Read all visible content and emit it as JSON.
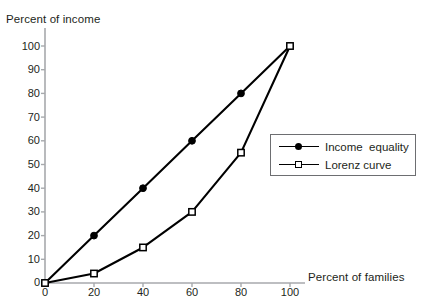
{
  "chart_data": {
    "type": "line",
    "title": "",
    "xlabel": "Percent of families",
    "ylabel": "Percent of income",
    "xlim": [
      0,
      100
    ],
    "ylim": [
      0,
      100
    ],
    "xticks": [
      "0",
      "20",
      "40",
      "60",
      "80",
      "100"
    ],
    "xtick_values": [
      0,
      20,
      40,
      60,
      80,
      100
    ],
    "yticks": [
      "0",
      "10",
      "20",
      "30",
      "40",
      "50",
      "60",
      "70",
      "80",
      "90",
      "100"
    ],
    "ytick_values": [
      0,
      10,
      20,
      30,
      40,
      50,
      60,
      70,
      80,
      90,
      100
    ],
    "grid": false,
    "legend_position": "right-middle",
    "series": [
      {
        "name": "Income  equality",
        "marker": "filled-circle",
        "color": "#000000",
        "x": [
          0,
          20,
          40,
          60,
          80,
          100
        ],
        "values": [
          0,
          20,
          40,
          60,
          80,
          100
        ]
      },
      {
        "name": "Lorenz curve",
        "marker": "open-square",
        "color": "#000000",
        "x": [
          0,
          20,
          40,
          60,
          80,
          100
        ],
        "values": [
          0,
          4,
          15,
          30,
          55,
          100
        ]
      }
    ]
  },
  "axes": {
    "y_title": "Percent of income",
    "x_title": "Percent of families",
    "axis_color": "#a7a9ac",
    "tick_color": "#a7a9ac"
  },
  "legend": {
    "items": [
      {
        "label": "Income  equality",
        "marker": "filled-circle"
      },
      {
        "label": "Lorenz curve",
        "marker": "open-square"
      }
    ]
  },
  "ytick_labels": {
    "t100": "100",
    "t90": "90",
    "t80": "80",
    "t70": "70",
    "t60": "60",
    "t50": "50",
    "t40": "40",
    "t30": "30",
    "t20": "20",
    "t10": "10",
    "t0": "0"
  },
  "xtick_labels": {
    "t0": "0",
    "t20": "20",
    "t40": "40",
    "t60": "60",
    "t80": "80",
    "t100": "100"
  }
}
